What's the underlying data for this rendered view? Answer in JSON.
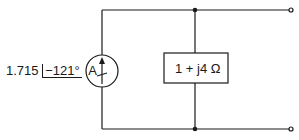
{
  "source": {
    "magnitude": "1.715",
    "angle": "−121°",
    "unit": "A",
    "type": "current-source"
  },
  "load": {
    "label": "1 + j4 Ω"
  },
  "colors": {
    "line": "#1a1a1a",
    "background": "#ffffff"
  }
}
